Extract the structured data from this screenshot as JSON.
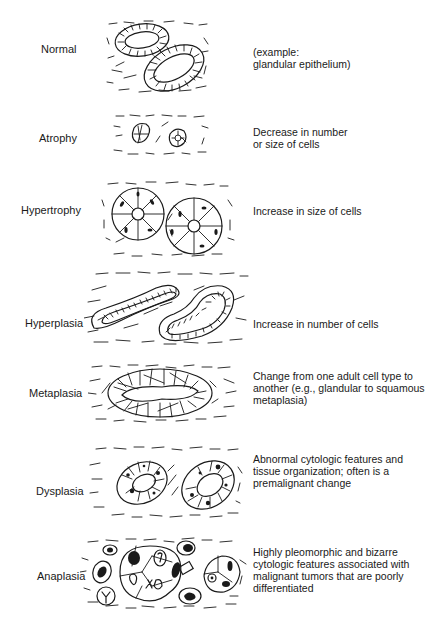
{
  "figure": {
    "rows": [
      {
        "label": "Normal",
        "description": "(example:\nglandular epithelium)"
      },
      {
        "label": "Atrophy",
        "description": "Decrease in number\nor size of cells"
      },
      {
        "label": "Hypertrophy",
        "description": "Increase in size of cells"
      },
      {
        "label": "Hyperplasia",
        "description": "Increase in number of cells"
      },
      {
        "label": "Metaplasia",
        "description": "Change from one adult cell type to\nanother (e.g., glandular to squamous\nmetaplasia)"
      },
      {
        "label": "Dysplasia",
        "description": "Abnormal cytologic features and\ntissue organization; often is a\npremalignant change"
      },
      {
        "label": "Anaplasia",
        "description": "Highly pleomorphic and bizarre\ncytologic features associated with\nmalignant tumors that are poorly\ndifferentiated"
      }
    ]
  }
}
